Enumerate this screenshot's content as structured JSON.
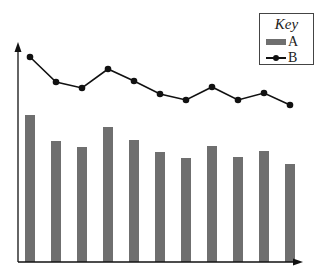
{
  "chart_data": {
    "type": "bar",
    "title": "",
    "xlabel": "",
    "ylabel": "",
    "grid": false,
    "legend_position": "top-right",
    "legend_title": "Key",
    "categories": [
      "1",
      "2",
      "3",
      "4",
      "5",
      "6",
      "7",
      "8",
      "9",
      "10",
      "11"
    ],
    "series": [
      {
        "name": "A",
        "type": "bar",
        "color": "#6f6f6f",
        "values": [
          147,
          121,
          115,
          135,
          122,
          110,
          104,
          116,
          105,
          111,
          98
        ]
      },
      {
        "name": "B",
        "type": "line",
        "color": "#111111",
        "marker": "circle",
        "values": [
          205,
          180,
          174,
          193,
          181,
          168,
          162,
          175,
          162,
          169,
          157
        ]
      }
    ],
    "ylim": [
      0,
      230
    ],
    "axes": {
      "x_arrow": true,
      "y_arrow": true,
      "tick_labels": false
    }
  },
  "legend": {
    "title": "Key",
    "items": [
      {
        "label": "A"
      },
      {
        "label": "B"
      }
    ]
  }
}
